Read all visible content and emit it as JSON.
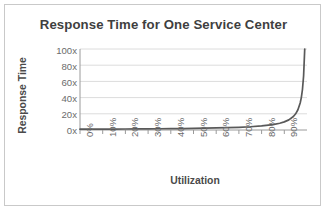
{
  "chart_data": {
    "type": "line",
    "title": "Response Time for One Service Center",
    "xlabel": "Utilization",
    "ylabel": "Response Time",
    "grid": true,
    "legend": false,
    "xtick_labels": [
      "0%",
      "10%",
      "20%",
      "30%",
      "40%",
      "50%",
      "60%",
      "70%",
      "80%",
      "90%"
    ],
    "ytick_labels": [
      "0x",
      "20x",
      "40x",
      "60x",
      "80x",
      "100x"
    ],
    "ytick_values": [
      0,
      20,
      40,
      60,
      80,
      100
    ],
    "xlim": [
      0,
      1.0
    ],
    "ylim": [
      0,
      100
    ],
    "line_color": "#595959",
    "series": [
      {
        "name": "Response Time",
        "x": [
          0,
          0.05,
          0.1,
          0.15,
          0.2,
          0.25,
          0.3,
          0.35,
          0.4,
          0.45,
          0.5,
          0.55,
          0.6,
          0.65,
          0.7,
          0.75,
          0.8,
          0.85,
          0.88,
          0.9,
          0.92,
          0.94,
          0.95,
          0.96,
          0.97,
          0.975,
          0.98,
          0.985,
          0.99,
          0.99
        ],
        "values": [
          1,
          1.05,
          1.11,
          1.18,
          1.25,
          1.33,
          1.43,
          1.54,
          1.67,
          1.82,
          2,
          2.22,
          2.5,
          2.86,
          3.33,
          4,
          5,
          6.67,
          8.33,
          10,
          12.5,
          16.67,
          20,
          25,
          33.3,
          40,
          50,
          66.7,
          100,
          100
        ]
      }
    ]
  },
  "colors": {
    "border": "#c9c9c9",
    "gridline": "#dcdcdc",
    "axis": "#9a9a9a",
    "title_text": "#3f3f3f",
    "tick_text": "#6b6b6b",
    "plot_background": "#ffffff"
  }
}
